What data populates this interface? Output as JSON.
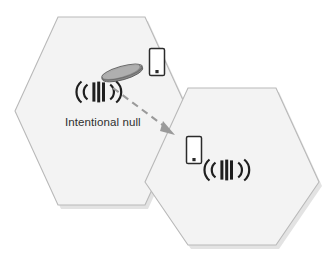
{
  "figure": {
    "background_color": "#ffffff"
  },
  "annotations": {
    "null_label": "Intentional null"
  },
  "cells": [
    {
      "id": "cell-upper-left",
      "name": "serving-cell",
      "fill_color": "#f3f3f3",
      "border_color": "#b9b9b9",
      "elements": {
        "signal_icon": "cell-signal-icon",
        "phone_icon": "smartphone-icon",
        "beam_icon": "beam-lobe-icon"
      }
    },
    {
      "id": "cell-lower-right",
      "name": "neighbor-cell",
      "fill_color": "#f3f3f3",
      "border_color": "#b9b9b9",
      "elements": {
        "signal_icon": "cell-signal-icon",
        "phone_icon": "smartphone-icon"
      }
    }
  ],
  "icons": {
    "signal": "cell-signal-icon",
    "phone": "smartphone-icon",
    "beam": "beam-lobe-icon",
    "arrow": "dashed-null-arrow-icon"
  },
  "colors": {
    "cell_fill": "#f3f3f3",
    "cell_border": "#b9b9b9",
    "icon_dark": "#1f1f1f",
    "beam_gray": "#8a8a8a",
    "arrow_gray": "#9a9a9a",
    "label_text": "#2f2f2f",
    "shadow": "#d9d9d9"
  },
  "ghost_scan_text": {
    "line_a": "",
    "line_b": "",
    "line_c": ""
  }
}
